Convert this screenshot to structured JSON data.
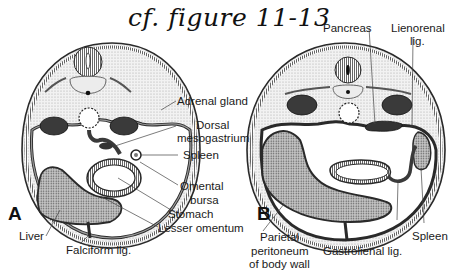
{
  "title": "cf. figure 11-13",
  "colors": {
    "outline": "#2a2a2a",
    "stipple_light": "#d9d9d9",
    "liver_fill": "#a8a8a8",
    "kidney_fill": "#3a3a3a",
    "background": "#ffffff"
  },
  "figure_a": {
    "panel_label": "A",
    "labels": {
      "adrenal_gland": "Adrenal gland",
      "dorsal": "Dorsal",
      "mesogastrium": "mesogastrium",
      "spleen": "Spleen",
      "omental": "Omental",
      "bursa": "bursa",
      "stomach": "Stomach",
      "lesser_omentum": "Lesser omentum",
      "liver": "Liver",
      "falciform_lig": "Falciform lig."
    }
  },
  "figure_b": {
    "panel_label": "B",
    "labels": {
      "pancreas": "Pancreas",
      "lienorenal": "Lienorenal",
      "lig": "lig.",
      "parietal": "Parietal",
      "peritoneum": "peritoneum",
      "of_body_wall": "of body wall",
      "gastrolienal_lig": "Gastrolienal lig.",
      "spleen": "Spleen"
    }
  }
}
